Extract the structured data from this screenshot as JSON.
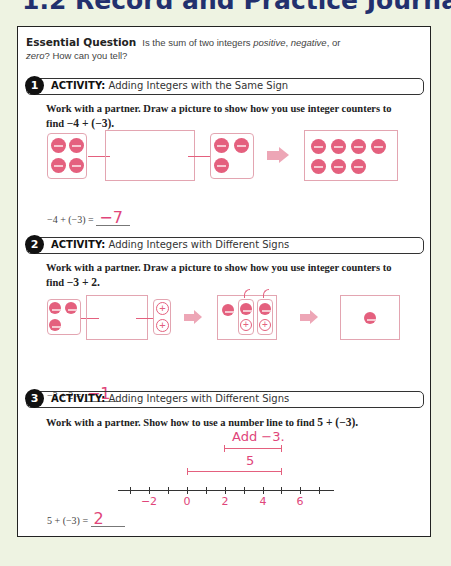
{
  "page_title": "1.2 Record and Practice Journal",
  "essential_question": {
    "label": "Essential Question",
    "text_1": "Is the sum of two integers ",
    "positive": "positive",
    "sep1": ", ",
    "negative": "negative",
    "sep2": ", or",
    "zero": "zero",
    "text_2": "? How can you tell?"
  },
  "colors": {
    "accent": "#e0457a",
    "counter": "#e4607e",
    "title": "#22306e"
  },
  "activities": [
    {
      "number": "1",
      "label": "ACTIVITY:",
      "title": "Adding Integers with the Same Sign",
      "instruction": "Work with a partner. Draw a picture to show how you use integer counters to find",
      "expression": "−4 + (−3).",
      "answer_prefix": "−4 + (−3) =",
      "answer": "−7",
      "counters": {
        "group_a": 4,
        "group_b": 3,
        "result": 7,
        "sign": "negative"
      }
    },
    {
      "number": "2",
      "label": "ACTIVITY:",
      "title": "Adding Integers with Different Signs",
      "instruction": "Work with a partner. Draw a picture to show how you use integer counters to find",
      "expression": "−3 + 2.",
      "answer_prefix": "−3 + 2 =",
      "answer": "−1",
      "counters": {
        "negative": 3,
        "positive": 2,
        "zero_pairs": 2,
        "result": 1
      }
    },
    {
      "number": "3",
      "label": "ACTIVITY:",
      "title": "Adding Integers with Different Signs",
      "instruction": "Work with a partner. Show how to use a number line to find",
      "expression": "5 + (−3).",
      "answer_prefix": "5 + (−3) =",
      "answer": "2",
      "number_line": {
        "top_label": "Add −3.",
        "mid_label": "5",
        "tick_labels": [
          "−2",
          "0",
          "2",
          "4",
          "6"
        ],
        "min": -3,
        "max": 7
      }
    }
  ]
}
